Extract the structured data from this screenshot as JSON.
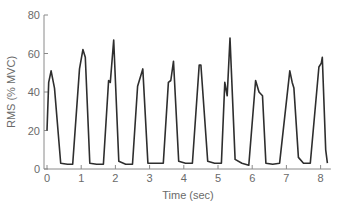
{
  "chart_data": {
    "type": "line",
    "title": "",
    "xlabel": "Time (sec)",
    "ylabel": "RMS (% MVC)",
    "xlim": [
      0,
      8.3
    ],
    "ylim": [
      0,
      80
    ],
    "x_ticks": [
      0,
      1,
      2,
      3,
      4,
      5,
      6,
      7,
      8
    ],
    "y_ticks": [
      0,
      20,
      40,
      60,
      80
    ],
    "grid": false,
    "legend": null,
    "line_color": "#2e2e2e",
    "series": [
      {
        "name": "RMS",
        "x": [
          0.0,
          0.05,
          0.12,
          0.22,
          0.4,
          0.6,
          0.75,
          0.95,
          1.05,
          1.12,
          1.25,
          1.45,
          1.65,
          1.8,
          1.85,
          1.95,
          2.1,
          2.3,
          2.5,
          2.65,
          2.8,
          2.95,
          3.2,
          3.4,
          3.55,
          3.62,
          3.7,
          3.85,
          4.05,
          4.25,
          4.45,
          4.5,
          4.7,
          4.9,
          5.1,
          5.2,
          5.27,
          5.35,
          5.5,
          5.7,
          5.9,
          6.1,
          6.2,
          6.3,
          6.4,
          6.6,
          6.8,
          7.1,
          7.17,
          7.22,
          7.35,
          7.5,
          7.7,
          7.95,
          8.02,
          8.05,
          8.15,
          8.2
        ],
        "y": [
          20,
          45,
          51,
          42,
          3,
          2.5,
          2.5,
          52,
          62,
          58,
          3,
          2.5,
          2.5,
          46,
          45,
          67,
          4,
          2.5,
          2.5,
          43,
          52,
          3,
          3,
          3,
          45,
          46,
          56,
          4,
          3,
          3,
          54,
          54,
          4,
          3,
          3,
          45,
          38,
          68,
          5,
          3,
          2,
          46,
          40,
          38,
          3,
          2.5,
          3,
          51,
          45,
          42,
          6,
          3,
          3,
          53,
          55,
          58,
          10,
          3
        ]
      }
    ]
  },
  "axes": {
    "xlabel": "Time (sec)",
    "ylabel": "RMS (% MVC)",
    "x_tick_labels": [
      "0",
      "1",
      "2",
      "3",
      "4",
      "5",
      "6",
      "7",
      "8"
    ],
    "y_tick_labels": [
      "0",
      "20",
      "40",
      "60",
      "80"
    ]
  }
}
